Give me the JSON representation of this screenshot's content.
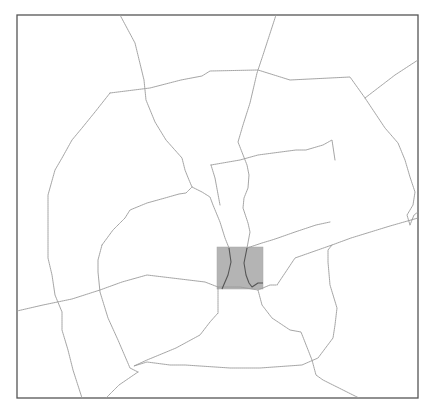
{
  "map": {
    "width": 421,
    "height": 411,
    "frame": {
      "x": 17,
      "y": 15,
      "width": 401,
      "height": 383
    },
    "colors": {
      "background": "#ffffff",
      "road": "#9a9a9a",
      "frame": "#555555",
      "highlight_fill": "#b4b4b4",
      "highlight_road": "#555555"
    },
    "highlight_area": {
      "x": 217,
      "y": 247,
      "width": 46,
      "height": 42
    },
    "roads": [
      {
        "id": "north-west-radial",
        "points": "120,15 135,43 144,80 146,100 155,122 166,140 182,158 185,170 189,180 192,187 202,192 210,197 213,205 220,222 225,238 229,248"
      },
      {
        "id": "north-east-radial",
        "points": "276,15 263,55 257,73 250,103 243,125 238,142 247,165 249,175 248,188 244,198 243,208 248,223 250,232 247,248"
      },
      {
        "id": "outer-ring-north",
        "points": "110,93 150,88 181,80 202,76 210,71 258,70 290,80 350,77 365,98 385,128 398,143 405,160 410,177 415,192 413,205 407,215 410,225"
      },
      {
        "id": "outer-ring-west",
        "points": "110,93 95,112 82,128 72,140 62,158 55,170 48,195 48,235 48,258 52,275 55,295 62,312 62,330 68,350 73,370 82,398"
      },
      {
        "id": "inner-ring-north",
        "points": "211,165 240,160 258,155 296,150 306,150 323,145 332,140 335,160"
      },
      {
        "id": "inner-ring-west-upper",
        "points": "102,245 113,230 125,218 130,210 147,203 165,198 179,194 186,193 192,187"
      },
      {
        "id": "inner-ring-west",
        "points": "102,245 98,260 98,272 100,292 108,318 118,340 130,368 138,372"
      },
      {
        "id": "west-east-arterial",
        "points": "17,311 43,305 72,299 100,290 122,282 147,275 172,278 205,282 218,287 240,287 258,290"
      },
      {
        "id": "east-arterial",
        "points": "258,290 270,285 277,285 295,258 332,245 351,238 390,226 418,218"
      },
      {
        "id": "south-inner-ring",
        "points": "218,287 218,313 210,322 200,335 176,348 147,360 134,366 147,362 170,365 185,365 230,368 260,368 302,365 318,358 333,338 335,325 337,308 330,285 328,262 328,250 332,245"
      },
      {
        "id": "south-radial",
        "points": "258,290 262,305 272,318 290,330 301,332 312,360 316,375 323,380 359,398"
      },
      {
        "id": "south-west-radial",
        "points": "138,372 119,385 106,398"
      },
      {
        "id": "east-spoke",
        "points": "247,248 262,243 272,240 278,238 295,232 316,225 330,222"
      },
      {
        "id": "east-edge",
        "points": "410,225 414,215 418,212"
      },
      {
        "id": "northeast-diagonal",
        "points": "418,60 395,75 365,98"
      },
      {
        "id": "inner-ring-link",
        "points": "211,165 215,178 220,205"
      }
    ],
    "highlight_roads": [
      {
        "id": "highlight-road-west",
        "points": "229,248 231,262 228,275 225,282 222,289"
      },
      {
        "id": "highlight-road-east",
        "points": "247,248 244,263 246,275 249,283 252,287 258,283 263,283"
      }
    ]
  }
}
